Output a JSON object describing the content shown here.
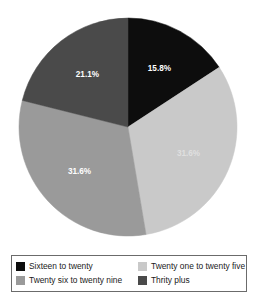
{
  "chart_data": {
    "type": "pie",
    "title": "",
    "subtitle": "",
    "xlabel": "",
    "ylabel": "",
    "grid": false,
    "legend_position": "bottom",
    "start_angle_deg": 0,
    "direction": "clockwise",
    "categories": [
      "Sixteen to twenty",
      "Twenty one to twenty five",
      "Twenty six to twenty nine",
      "Thrity plus"
    ],
    "values": [
      15.8,
      31.6,
      31.6,
      21.1
    ],
    "value_unit": "%",
    "data_labels": [
      "15.8%",
      "31.6%",
      "31.6%",
      "21.1%"
    ],
    "colors": [
      "#0d0d0d",
      "#c9c9c9",
      "#9a9a9a",
      "#4a4a4a"
    ],
    "slices": [
      {
        "label": "Sixteen to twenty",
        "value": 15.8,
        "data_label": "15.8%",
        "color": "#0d0d0d",
        "label_color": "#ffffff"
      },
      {
        "label": "Twenty one to twenty five",
        "value": 31.6,
        "data_label": "31.6%",
        "color": "#c9c9c9",
        "label_color": "#e8e8e8"
      },
      {
        "label": "Twenty six to twenty nine",
        "value": 31.6,
        "data_label": "31.6%",
        "color": "#9a9a9a",
        "label_color": "#ffffff"
      },
      {
        "label": "Thrity plus",
        "value": 21.1,
        "data_label": "21.1%",
        "color": "#4a4a4a",
        "label_color": "#ffffff"
      }
    ]
  },
  "legend": {
    "rows": [
      {
        "left": {
          "label": "Sixteen to twenty",
          "color": "#0d0d0d"
        },
        "right": {
          "label": "Twenty one to twenty five",
          "color": "#c9c9c9"
        }
      },
      {
        "left": {
          "label": "Twenty six to twenty nine",
          "color": "#9a9a9a"
        },
        "right": {
          "label": "Thrity plus",
          "color": "#4a4a4a"
        }
      }
    ]
  }
}
